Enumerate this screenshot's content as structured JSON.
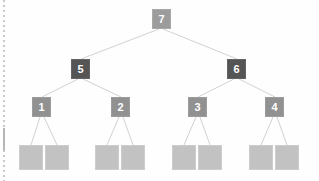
{
  "diagram": {
    "type": "tree",
    "background_color": "#fefefe",
    "edge_color": "#d2d2d2",
    "left_rule": {
      "name": "dotted-left-margin-rule",
      "color": "#c9c9c9"
    },
    "levels": [
      {
        "level": 0,
        "name": "root-level",
        "color": "#9c9c9c",
        "nodes": [
          {
            "id": "n7",
            "label": "7",
            "x": 152,
            "y": 9,
            "w": 19,
            "h": 20,
            "style": "node-root"
          }
        ]
      },
      {
        "level": 1,
        "name": "internal-level",
        "color": "#555555",
        "nodes": [
          {
            "id": "n5",
            "label": "5",
            "x": 71,
            "y": 59,
            "w": 19,
            "h": 20,
            "style": "node-internal"
          },
          {
            "id": "n6",
            "label": "6",
            "x": 227,
            "y": 59,
            "w": 19,
            "h": 20,
            "style": "node-internal"
          }
        ]
      },
      {
        "level": 2,
        "name": "mid-level",
        "color": "#919191",
        "nodes": [
          {
            "id": "n1",
            "label": "1",
            "x": 32,
            "y": 97,
            "w": 19,
            "h": 20,
            "style": "node-mid"
          },
          {
            "id": "n2",
            "label": "2",
            "x": 111,
            "y": 97,
            "w": 19,
            "h": 20,
            "style": "node-mid"
          },
          {
            "id": "n3",
            "label": "3",
            "x": 188,
            "y": 97,
            "w": 19,
            "h": 20,
            "style": "node-mid"
          },
          {
            "id": "n4",
            "label": "4",
            "x": 265,
            "y": 97,
            "w": 19,
            "h": 20,
            "style": "node-mid"
          }
        ]
      },
      {
        "level": 3,
        "name": "leaf-level",
        "color": "#c2c2c2",
        "nodes": [
          {
            "id": "L1",
            "label": "",
            "x": 19,
            "y": 145,
            "w": 24,
            "h": 25
          },
          {
            "id": "L2",
            "label": "",
            "x": 45,
            "y": 145,
            "w": 24,
            "h": 25
          },
          {
            "id": "L3",
            "label": "",
            "x": 95,
            "y": 145,
            "w": 24,
            "h": 25
          },
          {
            "id": "L4",
            "label": "",
            "x": 121,
            "y": 145,
            "w": 24,
            "h": 25
          },
          {
            "id": "L5",
            "label": "",
            "x": 172,
            "y": 145,
            "w": 24,
            "h": 25
          },
          {
            "id": "L6",
            "label": "",
            "x": 198,
            "y": 145,
            "w": 24,
            "h": 25
          },
          {
            "id": "L7",
            "label": "",
            "x": 249,
            "y": 145,
            "w": 24,
            "h": 25
          },
          {
            "id": "L8",
            "label": "",
            "x": 275,
            "y": 145,
            "w": 24,
            "h": 25
          }
        ]
      }
    ],
    "edges": [
      {
        "from": "n7",
        "to": "n5",
        "x1": 159,
        "y1": 29,
        "x2": 81,
        "y2": 59
      },
      {
        "from": "n7",
        "to": "n6",
        "x1": 163,
        "y1": 29,
        "x2": 237,
        "y2": 59
      },
      {
        "from": "n5",
        "to": "n1",
        "x1": 78,
        "y1": 79,
        "x2": 42,
        "y2": 97
      },
      {
        "from": "n5",
        "to": "n2",
        "x1": 83,
        "y1": 79,
        "x2": 121,
        "y2": 97
      },
      {
        "from": "n6",
        "to": "n3",
        "x1": 234,
        "y1": 79,
        "x2": 198,
        "y2": 97
      },
      {
        "from": "n6",
        "to": "n4",
        "x1": 239,
        "y1": 79,
        "x2": 275,
        "y2": 97
      },
      {
        "from": "n1",
        "to": "L1",
        "x1": 40,
        "y1": 117,
        "x2": 31,
        "y2": 145
      },
      {
        "from": "n1",
        "to": "L2",
        "x1": 44,
        "y1": 117,
        "x2": 57,
        "y2": 145
      },
      {
        "from": "n2",
        "to": "L3",
        "x1": 119,
        "y1": 117,
        "x2": 107,
        "y2": 145
      },
      {
        "from": "n2",
        "to": "L4",
        "x1": 123,
        "y1": 117,
        "x2": 133,
        "y2": 145
      },
      {
        "from": "n3",
        "to": "L5",
        "x1": 196,
        "y1": 117,
        "x2": 184,
        "y2": 145
      },
      {
        "from": "n3",
        "to": "L6",
        "x1": 200,
        "y1": 117,
        "x2": 210,
        "y2": 145
      },
      {
        "from": "n4",
        "to": "L7",
        "x1": 273,
        "y1": 117,
        "x2": 261,
        "y2": 145
      },
      {
        "from": "n4",
        "to": "L8",
        "x1": 277,
        "y1": 117,
        "x2": 287,
        "y2": 145
      }
    ]
  }
}
